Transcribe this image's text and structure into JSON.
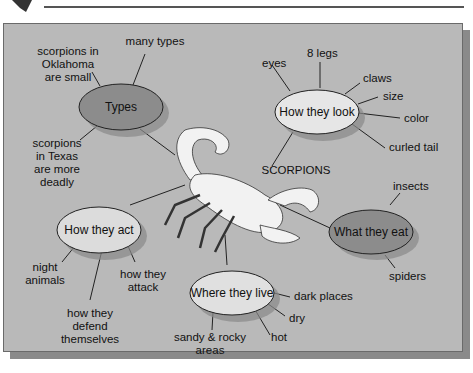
{
  "colors": {
    "panel": "#b9b9b9",
    "node_dark": "#8c8c8c",
    "node_light": "#e8e8e8",
    "line": "#222222"
  },
  "icons": {
    "corner": "corner-bookmark-icon",
    "scorpion": "scorpion-illustration"
  },
  "center": {
    "label": "SCORPIONS"
  },
  "nodes": {
    "types": {
      "label": "Types",
      "details": [
        "many types",
        "scorpions in Oklahoma are small",
        "scorpions in Texas are more deadly"
      ]
    },
    "look": {
      "label": "How they look",
      "details": [
        "eyes",
        "8 legs",
        "claws",
        "size",
        "color",
        "curled tail"
      ]
    },
    "act": {
      "label": "How they act",
      "details": [
        "night animals",
        "how they defend themselves",
        "how they attack"
      ]
    },
    "eat": {
      "label": "What they eat",
      "details": [
        "insects",
        "spiders"
      ]
    },
    "live": {
      "label": "Where they live",
      "details": [
        "dark places",
        "dry",
        "hot",
        "sandy & rocky areas"
      ]
    }
  },
  "text": {
    "many_types": "many types",
    "ok1": "scorpions in",
    "ok2": "Oklahoma",
    "ok3": "are small",
    "tx1": "scorpions",
    "tx2": "in Texas",
    "tx3": "are more",
    "tx4": "deadly",
    "eyes": "eyes",
    "legs": "8 legs",
    "claws": "claws",
    "size": "size",
    "color": "color",
    "tail": "curled tail",
    "night1": "night",
    "night2": "animals",
    "def1": "how they",
    "def2": "defend",
    "def3": "themselves",
    "att1": "how they",
    "att2": "attack",
    "insects": "insects",
    "spiders": "spiders",
    "dark": "dark places",
    "dry": "dry",
    "hot": "hot",
    "sandy1": "sandy & rocky",
    "sandy2": "areas"
  }
}
